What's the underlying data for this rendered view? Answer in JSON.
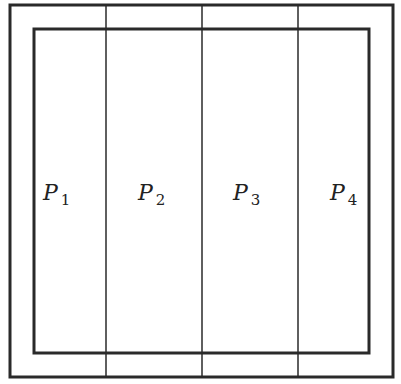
{
  "diagram": {
    "type": "partition-rectangles",
    "outer_rect": {
      "x": 10,
      "y": 5,
      "width": 383,
      "height": 372,
      "stroke": "#2a2a2a",
      "stroke_width": 3
    },
    "inner_rect": {
      "x": 34,
      "y": 29,
      "width": 335,
      "height": 324,
      "stroke": "#2a2a2a",
      "stroke_width": 3
    },
    "dividers": [
      {
        "x": 106,
        "y1": 5,
        "y2": 377
      },
      {
        "x": 202,
        "y1": 5,
        "y2": 377
      },
      {
        "x": 298,
        "y1": 5,
        "y2": 377
      }
    ],
    "divider_stroke": "#2a2a2a",
    "divider_stroke_width": 1.5,
    "partitions": [
      {
        "name": "P",
        "subscript": "1",
        "x": 43,
        "y": 200
      },
      {
        "name": "P",
        "subscript": "2",
        "x": 138,
        "y": 200
      },
      {
        "name": "P",
        "subscript": "3",
        "x": 233,
        "y": 200
      },
      {
        "name": "P",
        "subscript": "4",
        "x": 330,
        "y": 200
      }
    ]
  }
}
